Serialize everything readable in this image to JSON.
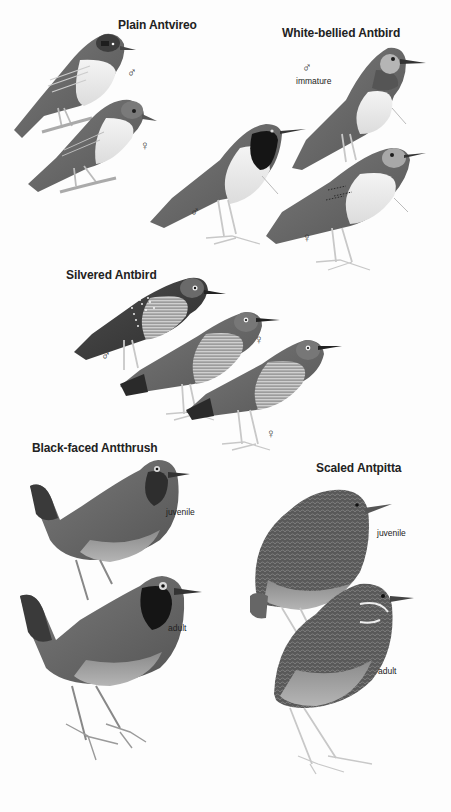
{
  "plate": {
    "species": [
      {
        "name": "Plain Antvireo",
        "figures": [
          {
            "symbol": "♂",
            "caption": ""
          },
          {
            "symbol": "♀",
            "caption": ""
          }
        ]
      },
      {
        "name": "White-bellied Antbird",
        "figures": [
          {
            "symbol": "♂",
            "caption": "immature"
          },
          {
            "symbol": "♂",
            "caption": ""
          },
          {
            "symbol": "♀",
            "caption": ""
          }
        ]
      },
      {
        "name": "Silvered Antbird",
        "figures": [
          {
            "symbol": "♂",
            "caption": ""
          },
          {
            "symbol": "♀",
            "caption": ""
          },
          {
            "symbol": "♀",
            "caption": ""
          }
        ]
      },
      {
        "name": "Black-faced Antthrush",
        "figures": [
          {
            "symbol": "",
            "caption": "juvenile"
          },
          {
            "symbol": "",
            "caption": "adult"
          }
        ]
      },
      {
        "name": "Scaled Antpitta",
        "figures": [
          {
            "symbol": "",
            "caption": "juvenile"
          },
          {
            "symbol": "",
            "caption": "adult"
          }
        ]
      }
    ]
  },
  "colors": {
    "background": "#fdfdfd",
    "text": "#222222",
    "bird_dark": "#3a3a3a",
    "bird_mid": "#6e6e6e",
    "bird_light": "#d9d9d9",
    "leg": "#c8c8c8"
  }
}
